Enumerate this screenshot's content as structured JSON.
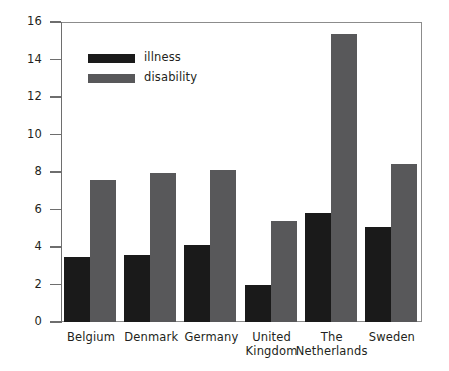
{
  "chart_data": {
    "type": "bar",
    "title": "",
    "subtitle": "",
    "xlabel": "",
    "ylabel": "",
    "categories": [
      "Belgium",
      "Denmark",
      "Germany",
      "United Kingdom",
      "The Netherlands",
      "Sweden"
    ],
    "category_labels_wrapped": [
      [
        "Belgium"
      ],
      [
        "Denmark"
      ],
      [
        "Germany"
      ],
      [
        "United",
        "Kingdom"
      ],
      [
        "The",
        "Netherlands"
      ],
      [
        "Sweden"
      ]
    ],
    "series": [
      {
        "name": "illness",
        "color": "#1a1a1a",
        "values": [
          3.45,
          3.6,
          4.1,
          2.0,
          5.8,
          5.05
        ]
      },
      {
        "name": "disability",
        "color": "#58585a",
        "values": [
          7.6,
          7.95,
          8.1,
          5.4,
          15.35,
          8.45
        ]
      }
    ],
    "ylim": [
      0,
      16
    ],
    "yticks": [
      0,
      2,
      4,
      6,
      8,
      10,
      12,
      14,
      16
    ],
    "ytick_labels": [
      "0",
      "2",
      "4",
      "6",
      "8",
      "10",
      "12",
      "14",
      "16"
    ],
    "grid": false,
    "legend_position": "top-left",
    "legend_entries": [
      {
        "label": "illness",
        "color": "#1a1a1a"
      },
      {
        "label": "disability",
        "color": "#58585a"
      }
    ],
    "frame_color": "#8c8c8c",
    "background": "#ffffff"
  }
}
